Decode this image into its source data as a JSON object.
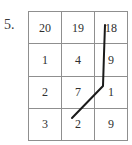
{
  "figure": {
    "item_number": "5.",
    "background_color": "#ffffff",
    "grid_border_color": "#8f8f8f",
    "digit_color": "#2f2f2f",
    "overlay_color": "#1a1a1a"
  },
  "grid": {
    "columns": 3,
    "rows": 4,
    "cells": [
      [
        "20",
        "19",
        "18"
      ],
      [
        "1",
        "4",
        "9"
      ],
      [
        "2",
        "7",
        "1"
      ],
      [
        "3",
        "2",
        "9"
      ]
    ]
  },
  "overlay": {
    "name": "path-annotation",
    "description": "hand-drawn connecting line",
    "points": "105,25 104,54 103,86 72,118"
  }
}
